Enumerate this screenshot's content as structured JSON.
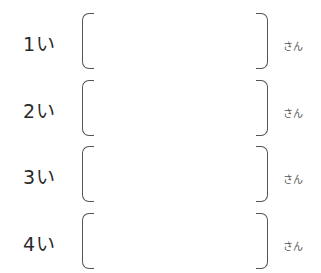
{
  "rows": [
    {
      "label": "1い",
      "answer": "",
      "unit": "さん"
    },
    {
      "label": "2い",
      "answer": "",
      "unit": "さん"
    },
    {
      "label": "3い",
      "answer": "",
      "unit": "さん"
    },
    {
      "label": "4い",
      "answer": "",
      "unit": "さん"
    }
  ]
}
